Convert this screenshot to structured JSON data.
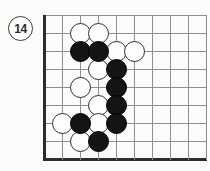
{
  "diagram": {
    "kind": "go-board-diagram",
    "move_number_label": "14",
    "board": {
      "columns": 10,
      "rows": 9,
      "origin_x": 44,
      "origin_y": 15,
      "cell": 18,
      "line_color": "#8e8e92",
      "edge_color": "#2c2c2c",
      "background_color": "#fbfbfa",
      "edges": [
        "left",
        "bottom"
      ]
    },
    "colors": {
      "black_stone": "#141414",
      "white_stone": "#fdfdfd",
      "stone_outline": "#2e2e2e",
      "badge_text": "#2b2b2b"
    },
    "badge": {
      "x": 8,
      "y": 16
    },
    "stones": [
      {
        "color": "white",
        "col": 2,
        "row": 1
      },
      {
        "color": "white",
        "col": 3,
        "row": 1
      },
      {
        "color": "black",
        "col": 2,
        "row": 2
      },
      {
        "color": "black",
        "col": 3,
        "row": 2
      },
      {
        "color": "white",
        "col": 4,
        "row": 2
      },
      {
        "color": "white",
        "col": 5,
        "row": 2
      },
      {
        "color": "white",
        "col": 3,
        "row": 3
      },
      {
        "color": "black",
        "col": 4,
        "row": 3
      },
      {
        "color": "white",
        "col": 2,
        "row": 4
      },
      {
        "color": "black",
        "col": 4,
        "row": 4
      },
      {
        "color": "white",
        "col": 3,
        "row": 5
      },
      {
        "color": "black",
        "col": 4,
        "row": 5
      },
      {
        "color": "white",
        "col": 1,
        "row": 6
      },
      {
        "color": "black",
        "col": 2,
        "row": 6
      },
      {
        "color": "white",
        "col": 3,
        "row": 6
      },
      {
        "color": "black",
        "col": 4,
        "row": 6
      },
      {
        "color": "white",
        "col": 2,
        "row": 7
      },
      {
        "color": "black",
        "col": 3,
        "row": 7
      }
    ]
  }
}
